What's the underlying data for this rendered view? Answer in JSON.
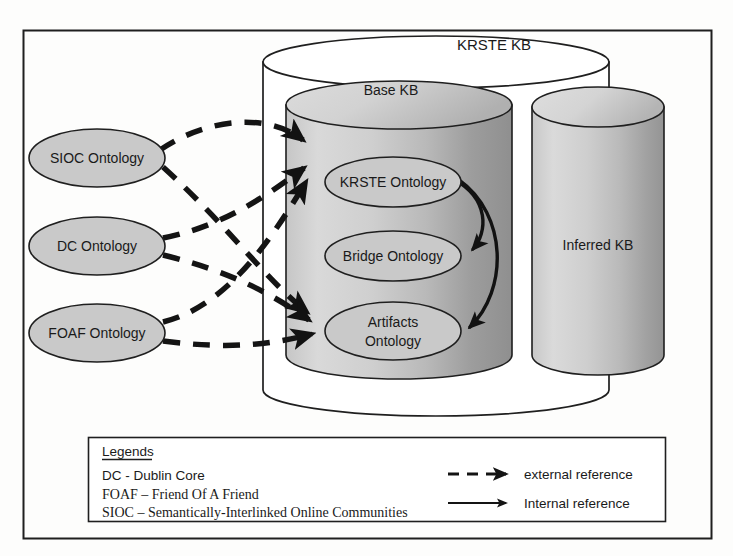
{
  "figure": {
    "outer_frame": {
      "name": "diagram-border"
    }
  },
  "containers": {
    "outer_kb": {
      "label": "KRSTE KB"
    },
    "base_kb": {
      "label": "Base KB"
    },
    "inferred_kb": {
      "label": "Inferred KB"
    }
  },
  "external_ontologies": [
    {
      "id": "sioc",
      "label": "SIOC Ontology"
    },
    {
      "id": "dc",
      "label": "DC Ontology"
    },
    {
      "id": "foaf",
      "label": "FOAF Ontology"
    }
  ],
  "internal_ontologies": [
    {
      "id": "krste",
      "label": "KRSTE Ontology",
      "line1": "KRSTE Ontology",
      "line2": ""
    },
    {
      "id": "bridge",
      "label": "Bridge Ontology",
      "line1": "Bridge Ontology",
      "line2": ""
    },
    {
      "id": "artifacts",
      "label": "Artifacts Ontology",
      "line1": "Artifacts",
      "line2": "Ontology"
    }
  ],
  "edges": {
    "external": [
      {
        "from": "SIOC Ontology",
        "to": "KRSTE Ontology",
        "type": "external reference"
      },
      {
        "from": "SIOC Ontology",
        "to": "Artifacts Ontology",
        "type": "external reference"
      },
      {
        "from": "DC Ontology",
        "to": "KRSTE Ontology",
        "type": "external reference"
      },
      {
        "from": "DC Ontology",
        "to": "Artifacts Ontology",
        "type": "external reference"
      },
      {
        "from": "FOAF Ontology",
        "to": "KRSTE Ontology",
        "type": "external reference"
      },
      {
        "from": "FOAF Ontology",
        "to": "Artifacts Ontology",
        "type": "external reference"
      }
    ],
    "internal": [
      {
        "from": "KRSTE Ontology",
        "to": "Bridge Ontology",
        "type": "Internal reference"
      },
      {
        "from": "KRSTE Ontology",
        "to": "Artifacts Ontology",
        "type": "Internal reference"
      }
    ]
  },
  "legend": {
    "title": "Legends",
    "abbreviations": [
      {
        "text": "DC - Dublin Core",
        "font": "sans"
      },
      {
        "text": "FOAF – Friend Of A Friend",
        "font": "serif"
      },
      {
        "text": "SIOC – Semantically-Interlinked Online Communities",
        "font": "serif"
      }
    ],
    "keys": [
      {
        "style": "dashed",
        "label": "external reference"
      },
      {
        "style": "solid",
        "label": "Internal reference"
      }
    ]
  },
  "colors": {
    "stroke": "#1a1a1a",
    "page_bg": "#fdfdfc",
    "ellipse_fill": "#c9c9c9",
    "cylinder_light": "#d6d6d6",
    "cylinder_mid": "#c0c0c0",
    "cylinder_dark": "#9a9a9a",
    "outer_kb_fill": "#ffffff"
  }
}
